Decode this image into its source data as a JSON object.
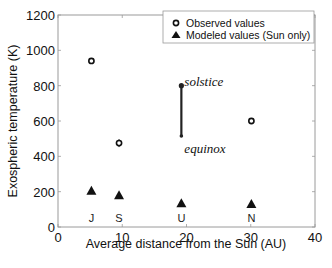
{
  "chart_data": {
    "type": "scatter",
    "title": "",
    "xlabel": "Average distance from the Sun (AU)",
    "ylabel": "Exospheric temperature (K)",
    "xlim": [
      0,
      40
    ],
    "ylim": [
      0,
      1200
    ],
    "xticks": [
      "0",
      "10",
      "20",
      "30",
      "40"
    ],
    "yticks": [
      "0",
      "200",
      "400",
      "600",
      "800",
      "1000",
      "1200"
    ],
    "grid": false,
    "legend_position": "upper right",
    "legend": [
      "Observed values",
      "Modeled values (Sun only)"
    ],
    "series": [
      {
        "name": "Observed values",
        "marker": "open-circle",
        "points": [
          {
            "planet": "J",
            "x": 5.2,
            "y": 940
          },
          {
            "planet": "S",
            "x": 9.5,
            "y": 475
          },
          {
            "planet": "N",
            "x": 30.1,
            "y": 600
          }
        ]
      },
      {
        "name": "Modeled values (Sun only)",
        "marker": "filled-triangle",
        "points": [
          {
            "planet": "J",
            "x": 5.2,
            "y": 205
          },
          {
            "planet": "S",
            "x": 9.5,
            "y": 180
          },
          {
            "planet": "U",
            "x": 19.2,
            "y": 135
          },
          {
            "planet": "N",
            "x": 30.1,
            "y": 130
          }
        ]
      }
    ],
    "range_bars": [
      {
        "planet": "U",
        "x": 19.2,
        "y_low": 515,
        "y_high": 800,
        "label_high": "solstice",
        "label_low": "equinox"
      }
    ],
    "planet_labels": [
      {
        "text": "J",
        "x": 5.2
      },
      {
        "text": "S",
        "x": 9.5
      },
      {
        "text": "U",
        "x": 19.2
      },
      {
        "text": "N",
        "x": 30.1
      }
    ]
  }
}
